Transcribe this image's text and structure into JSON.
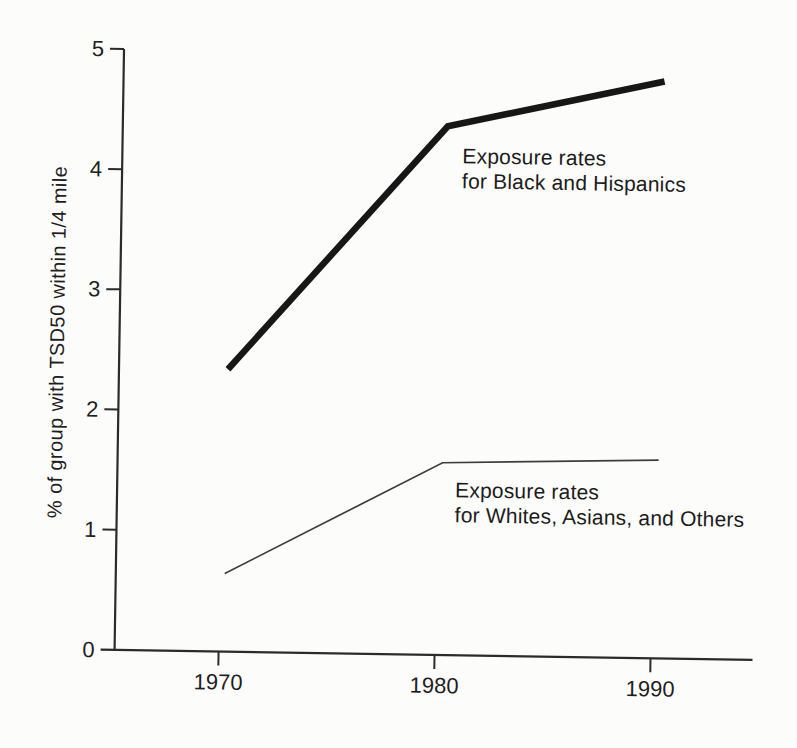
{
  "page": {
    "background_color": "#fcfcfa"
  },
  "chart_data": {
    "type": "line",
    "title": "",
    "xlabel": "",
    "ylabel": "% of group with TSD50 within 1/4 mile",
    "x": [
      1970,
      1980,
      1990
    ],
    "x_tick_labels": [
      "1970",
      "1980",
      "1990"
    ],
    "y_ticks": [
      0,
      1,
      2,
      3,
      4,
      5
    ],
    "ylim": [
      0,
      5
    ],
    "grid": false,
    "legend_position": "inline annotations beside lines",
    "axis_color": "#2b2b2b",
    "text_color": "#1e1e1e",
    "series": [
      {
        "name": "Exposure rates for Black and Hispanics",
        "values": [
          2.35,
          4.4,
          4.8
        ],
        "color": "#171717",
        "stroke_width_px": 6.5
      },
      {
        "name": "Exposure rates for Whites, Asians, and Others",
        "values": [
          0.65,
          1.6,
          1.65
        ],
        "color": "#3d3d3d",
        "stroke_width_px": 1.7
      }
    ],
    "annotations": [
      {
        "line1": "Exposure rates",
        "line2": "for Black and Hispanics"
      },
      {
        "line1": "Exposure rates",
        "line2": "for Whites, Asians, and Others"
      }
    ]
  }
}
